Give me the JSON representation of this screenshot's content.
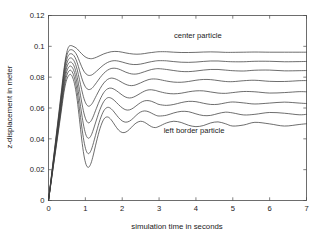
{
  "chart_data": {
    "type": "line",
    "title": "",
    "xlabel": "simulation time in seconds",
    "ylabel": "z-displacement in meter",
    "xlim": [
      0,
      7
    ],
    "ylim": [
      0,
      0.12
    ],
    "xticks": [
      "0",
      "1",
      "2",
      "3",
      "4",
      "5",
      "6",
      "7"
    ],
    "xtick_values": [
      0,
      1,
      2,
      3,
      4,
      5,
      6,
      7
    ],
    "yticks": [
      "0",
      "0.02",
      "0.04",
      "0.06",
      "0.08",
      "0.1",
      "0.12"
    ],
    "ytick_values": [
      0,
      0.02,
      0.04,
      0.06,
      0.08,
      0.1,
      0.12
    ],
    "grid": false,
    "legend_position": "none",
    "annotations": [
      {
        "text": "center particle",
        "x": 4.05,
        "y": 0.1055
      },
      {
        "text": "left border particle",
        "x": 3.95,
        "y": 0.0435
      }
    ],
    "series": [
      {
        "name": "center particle",
        "steady_state": 0.0962,
        "first_peak": 0.1005,
        "x": [
          0,
          0.06,
          0.12,
          0.18,
          0.24,
          0.3,
          0.36,
          0.42,
          0.48,
          0.54,
          0.6,
          0.66,
          0.72,
          0.78,
          0.84,
          0.9,
          0.96,
          1.02,
          1.08,
          1.14,
          1.2,
          1.3,
          1.4,
          1.5,
          1.6,
          1.7,
          1.8,
          1.9,
          2.0,
          2.1,
          2.2,
          2.3,
          2.4,
          2.5,
          2.6,
          2.7,
          2.8,
          2.9,
          3.0,
          3.2,
          3.4,
          3.6,
          3.8,
          4.0,
          4.2,
          4.4,
          4.6,
          4.8,
          5.0,
          5.3,
          5.6,
          6.0,
          6.4,
          6.8,
          7.0
        ],
        "y": [
          0,
          0.0121,
          0.0243,
          0.0364,
          0.0486,
          0.0608,
          0.0731,
          0.0851,
          0.0944,
          0.0994,
          0.1005,
          0.1001,
          0.0994,
          0.0983,
          0.0967,
          0.0952,
          0.0938,
          0.0928,
          0.0922,
          0.092,
          0.0921,
          0.0929,
          0.094,
          0.0951,
          0.0959,
          0.0965,
          0.0967,
          0.0966,
          0.0962,
          0.0957,
          0.0953,
          0.095,
          0.0949,
          0.095,
          0.0953,
          0.0957,
          0.096,
          0.0963,
          0.0965,
          0.0965,
          0.0962,
          0.096,
          0.096,
          0.0961,
          0.0963,
          0.0964,
          0.0963,
          0.0961,
          0.0961,
          0.0962,
          0.0963,
          0.0962,
          0.0962,
          0.0962,
          0.0962
        ]
      },
      {
        "name": "particle 2",
        "steady_state": 0.0902,
        "first_peak": 0.0978,
        "x": [
          0,
          0.06,
          0.12,
          0.18,
          0.24,
          0.3,
          0.36,
          0.42,
          0.48,
          0.54,
          0.6,
          0.66,
          0.72,
          0.78,
          0.84,
          0.9,
          0.96,
          1.02,
          1.08,
          1.14,
          1.2,
          1.3,
          1.4,
          1.5,
          1.6,
          1.7,
          1.8,
          1.9,
          2.0,
          2.1,
          2.2,
          2.3,
          2.4,
          2.5,
          2.6,
          2.7,
          2.8,
          2.9,
          3.0,
          3.2,
          3.4,
          3.6,
          3.8,
          4.0,
          4.2,
          4.4,
          4.6,
          4.8,
          5.0,
          5.3,
          5.6,
          6.0,
          6.4,
          6.8,
          7.0
        ],
        "y": [
          0,
          0.0118,
          0.0237,
          0.0355,
          0.0474,
          0.0593,
          0.0714,
          0.0836,
          0.0925,
          0.0967,
          0.0978,
          0.0975,
          0.0962,
          0.0938,
          0.0903,
          0.0868,
          0.0839,
          0.0821,
          0.0812,
          0.0812,
          0.0818,
          0.0838,
          0.086,
          0.088,
          0.0895,
          0.0904,
          0.0907,
          0.0904,
          0.0898,
          0.0891,
          0.0885,
          0.0882,
          0.0882,
          0.0885,
          0.089,
          0.0896,
          0.0901,
          0.0905,
          0.0907,
          0.0906,
          0.0901,
          0.0897,
          0.0896,
          0.0898,
          0.0902,
          0.0905,
          0.0905,
          0.0902,
          0.09,
          0.09,
          0.0903,
          0.0903,
          0.09,
          0.0901,
          0.0902
        ]
      },
      {
        "name": "particle 3",
        "steady_state": 0.0843,
        "first_peak": 0.0952,
        "x": [
          0,
          0.06,
          0.12,
          0.18,
          0.24,
          0.3,
          0.36,
          0.42,
          0.48,
          0.54,
          0.6,
          0.66,
          0.72,
          0.78,
          0.84,
          0.9,
          0.96,
          1.02,
          1.08,
          1.14,
          1.2,
          1.3,
          1.4,
          1.5,
          1.6,
          1.7,
          1.8,
          1.9,
          2.0,
          2.1,
          2.2,
          2.3,
          2.4,
          2.5,
          2.6,
          2.7,
          2.8,
          2.9,
          3.0,
          3.2,
          3.4,
          3.6,
          3.8,
          4.0,
          4.2,
          4.4,
          4.6,
          4.8,
          5.0,
          5.3,
          5.6,
          6.0,
          6.4,
          6.8,
          7.0
        ],
        "y": [
          0,
          0.0115,
          0.0231,
          0.0346,
          0.0462,
          0.0578,
          0.0697,
          0.0816,
          0.0901,
          0.0941,
          0.0952,
          0.0947,
          0.0928,
          0.0893,
          0.0845,
          0.0796,
          0.0756,
          0.0731,
          0.072,
          0.0722,
          0.0733,
          0.0764,
          0.0797,
          0.0825,
          0.0845,
          0.0856,
          0.0858,
          0.0853,
          0.0843,
          0.0832,
          0.0824,
          0.082,
          0.0821,
          0.0827,
          0.0835,
          0.0843,
          0.085,
          0.0854,
          0.0855,
          0.085,
          0.0843,
          0.0837,
          0.0836,
          0.084,
          0.0846,
          0.085,
          0.085,
          0.0846,
          0.0842,
          0.084,
          0.0845,
          0.0846,
          0.0841,
          0.0842,
          0.0843
        ]
      },
      {
        "name": "particle 4",
        "steady_state": 0.0775,
        "first_peak": 0.0925,
        "x": [
          0,
          0.06,
          0.12,
          0.18,
          0.24,
          0.3,
          0.36,
          0.42,
          0.48,
          0.54,
          0.6,
          0.66,
          0.72,
          0.78,
          0.84,
          0.9,
          0.96,
          1.02,
          1.08,
          1.14,
          1.2,
          1.3,
          1.4,
          1.5,
          1.6,
          1.7,
          1.8,
          1.9,
          2.0,
          2.1,
          2.2,
          2.3,
          2.4,
          2.5,
          2.6,
          2.7,
          2.8,
          2.9,
          3.0,
          3.2,
          3.4,
          3.6,
          3.8,
          4.0,
          4.2,
          4.4,
          4.6,
          4.8,
          5.0,
          5.3,
          5.6,
          6.0,
          6.4,
          6.8,
          7.0
        ],
        "y": [
          0,
          0.0112,
          0.0225,
          0.0337,
          0.045,
          0.0563,
          0.0679,
          0.0794,
          0.0875,
          0.0914,
          0.0925,
          0.0917,
          0.0892,
          0.0847,
          0.0785,
          0.0719,
          0.0663,
          0.0627,
          0.0612,
          0.0617,
          0.0635,
          0.0681,
          0.0726,
          0.0762,
          0.0785,
          0.0794,
          0.079,
          0.0779,
          0.0765,
          0.0753,
          0.0746,
          0.0746,
          0.0753,
          0.0763,
          0.0774,
          0.0783,
          0.0788,
          0.0788,
          0.0785,
          0.0775,
          0.0768,
          0.0767,
          0.0772,
          0.078,
          0.0785,
          0.0784,
          0.0778,
          0.0772,
          0.0771,
          0.0777,
          0.078,
          0.0773,
          0.0772,
          0.0777,
          0.0778
        ]
      },
      {
        "name": "particle 5",
        "steady_state": 0.0702,
        "first_peak": 0.0898,
        "x": [
          0,
          0.06,
          0.12,
          0.18,
          0.24,
          0.3,
          0.36,
          0.42,
          0.48,
          0.54,
          0.6,
          0.66,
          0.72,
          0.78,
          0.84,
          0.9,
          0.96,
          1.02,
          1.08,
          1.14,
          1.2,
          1.3,
          1.4,
          1.5,
          1.6,
          1.7,
          1.8,
          1.9,
          2.0,
          2.1,
          2.2,
          2.3,
          2.4,
          2.5,
          2.6,
          2.7,
          2.8,
          2.9,
          3.0,
          3.2,
          3.4,
          3.6,
          3.8,
          4.0,
          4.2,
          4.4,
          4.6,
          4.8,
          5.0,
          5.3,
          5.6,
          6.0,
          6.4,
          6.8,
          7.0
        ],
        "y": [
          0,
          0.0109,
          0.0219,
          0.0328,
          0.0437,
          0.0547,
          0.066,
          0.0771,
          0.085,
          0.0888,
          0.0898,
          0.0887,
          0.0855,
          0.0798,
          0.0721,
          0.0639,
          0.0568,
          0.0522,
          0.0504,
          0.0512,
          0.0537,
          0.0598,
          0.0656,
          0.07,
          0.0724,
          0.0729,
          0.0719,
          0.0702,
          0.0684,
          0.067,
          0.0665,
          0.067,
          0.0682,
          0.0696,
          0.0709,
          0.0717,
          0.0718,
          0.0714,
          0.0707,
          0.0696,
          0.0692,
          0.0696,
          0.0705,
          0.0711,
          0.0711,
          0.0704,
          0.0697,
          0.0695,
          0.07,
          0.0707,
          0.0705,
          0.0697,
          0.07,
          0.0706,
          0.0705
        ]
      },
      {
        "name": "particle 6",
        "steady_state": 0.0632,
        "first_peak": 0.0872,
        "x": [
          0,
          0.06,
          0.12,
          0.18,
          0.24,
          0.3,
          0.36,
          0.42,
          0.48,
          0.54,
          0.6,
          0.66,
          0.72,
          0.78,
          0.84,
          0.9,
          0.96,
          1.02,
          1.08,
          1.14,
          1.2,
          1.3,
          1.4,
          1.5,
          1.6,
          1.7,
          1.8,
          1.9,
          2.0,
          2.1,
          2.2,
          2.3,
          2.4,
          2.5,
          2.6,
          2.7,
          2.8,
          2.9,
          3.0,
          3.2,
          3.4,
          3.6,
          3.8,
          4.0,
          4.2,
          4.4,
          4.6,
          4.8,
          5.0,
          5.3,
          5.6,
          6.0,
          6.4,
          6.8,
          7.0
        ],
        "y": [
          0,
          0.0106,
          0.0212,
          0.0318,
          0.0425,
          0.0532,
          0.0641,
          0.0749,
          0.0825,
          0.0862,
          0.0872,
          0.0857,
          0.0818,
          0.0751,
          0.0659,
          0.0562,
          0.0478,
          0.0423,
          0.0404,
          0.0415,
          0.0448,
          0.0522,
          0.0592,
          0.0642,
          0.0666,
          0.0664,
          0.0646,
          0.0622,
          0.0601,
          0.0588,
          0.0588,
          0.06,
          0.0618,
          0.0635,
          0.0646,
          0.0648,
          0.0643,
          0.0633,
          0.0623,
          0.0617,
          0.0623,
          0.0635,
          0.0643,
          0.0641,
          0.0631,
          0.0623,
          0.0624,
          0.0633,
          0.0639,
          0.0633,
          0.0626,
          0.0632,
          0.0638,
          0.0632,
          0.0629
        ]
      },
      {
        "name": "particle 7",
        "steady_state": 0.0563,
        "first_peak": 0.0845,
        "x": [
          0,
          0.06,
          0.12,
          0.18,
          0.24,
          0.3,
          0.36,
          0.42,
          0.48,
          0.54,
          0.6,
          0.66,
          0.72,
          0.78,
          0.84,
          0.9,
          0.96,
          1.02,
          1.08,
          1.14,
          1.2,
          1.3,
          1.4,
          1.5,
          1.6,
          1.7,
          1.8,
          1.9,
          2.0,
          2.1,
          2.2,
          2.3,
          2.4,
          2.5,
          2.6,
          2.7,
          2.8,
          2.9,
          3.0,
          3.2,
          3.4,
          3.6,
          3.8,
          4.0,
          4.2,
          4.4,
          4.6,
          4.8,
          5.0,
          5.3,
          5.6,
          6.0,
          6.4,
          6.8,
          7.0
        ],
        "y": [
          0,
          0.0103,
          0.0206,
          0.0309,
          0.0412,
          0.0516,
          0.0622,
          0.0726,
          0.0799,
          0.0835,
          0.0845,
          0.0826,
          0.078,
          0.0702,
          0.0595,
          0.0483,
          0.0387,
          0.0325,
          0.0304,
          0.0318,
          0.0357,
          0.0444,
          0.0525,
          0.0582,
          0.0604,
          0.0595,
          0.0568,
          0.0538,
          0.0516,
          0.0508,
          0.0515,
          0.0534,
          0.0557,
          0.0574,
          0.0581,
          0.0577,
          0.0566,
          0.0554,
          0.0548,
          0.0553,
          0.0568,
          0.0578,
          0.0576,
          0.0562,
          0.0551,
          0.0552,
          0.0564,
          0.0573,
          0.0568,
          0.0555,
          0.0559,
          0.0571,
          0.0566,
          0.0556,
          0.0559
        ]
      },
      {
        "name": "left border particle",
        "steady_state": 0.0496,
        "first_peak": 0.0818,
        "x": [
          0,
          0.06,
          0.12,
          0.18,
          0.24,
          0.3,
          0.36,
          0.42,
          0.48,
          0.54,
          0.6,
          0.66,
          0.72,
          0.78,
          0.84,
          0.9,
          0.96,
          1.02,
          1.08,
          1.14,
          1.2,
          1.3,
          1.4,
          1.5,
          1.6,
          1.7,
          1.8,
          1.9,
          2.0,
          2.1,
          2.2,
          2.3,
          2.4,
          2.5,
          2.6,
          2.7,
          2.8,
          2.9,
          3.0,
          3.2,
          3.4,
          3.6,
          3.8,
          4.0,
          4.2,
          4.4,
          4.6,
          4.8,
          5.0,
          5.3,
          5.6,
          6.0,
          6.4,
          6.8,
          7.0
        ],
        "y": [
          0,
          0.01,
          0.02,
          0.03,
          0.04,
          0.05,
          0.0603,
          0.0703,
          0.0773,
          0.0808,
          0.0818,
          0.0795,
          0.0741,
          0.065,
          0.0527,
          0.0399,
          0.0295,
          0.0233,
          0.0215,
          0.0234,
          0.028,
          0.038,
          0.0469,
          0.0527,
          0.0542,
          0.0524,
          0.0489,
          0.0457,
          0.0441,
          0.0444,
          0.0462,
          0.0487,
          0.0506,
          0.0514,
          0.0508,
          0.0493,
          0.0478,
          0.0473,
          0.0481,
          0.0503,
          0.0514,
          0.0506,
          0.0488,
          0.0479,
          0.0486,
          0.0503,
          0.051,
          0.0498,
          0.0483,
          0.049,
          0.0507,
          0.0497,
          0.0483,
          0.0493,
          0.0498
        ]
      }
    ]
  },
  "colors": {
    "line": "#3d3d3d",
    "axis": "#4a4a4a",
    "text": "#1a1a1a",
    "background": "#ffffff"
  }
}
